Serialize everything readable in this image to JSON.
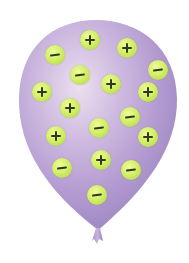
{
  "figure": {
    "balloon_color": "#b9a2d4",
    "balloon_highlight": "#e6d6ee",
    "balloon_shadow": "#9d86c2",
    "charge_color": "#cfe962",
    "sign_color": "#2f3a1c"
  },
  "charges": [
    {
      "type": "positive",
      "symbol": "+",
      "x": 90,
      "y": 40
    },
    {
      "type": "negative",
      "symbol": "−",
      "x": 55,
      "y": 55
    },
    {
      "type": "positive",
      "symbol": "+",
      "x": 127,
      "y": 48
    },
    {
      "type": "negative",
      "symbol": "−",
      "x": 158,
      "y": 70
    },
    {
      "type": "negative",
      "symbol": "−",
      "x": 80,
      "y": 75
    },
    {
      "type": "positive",
      "symbol": "+",
      "x": 111,
      "y": 84
    },
    {
      "type": "positive",
      "symbol": "+",
      "x": 42,
      "y": 92
    },
    {
      "type": "positive",
      "symbol": "+",
      "x": 148,
      "y": 92
    },
    {
      "type": "positive",
      "symbol": "+",
      "x": 70,
      "y": 108
    },
    {
      "type": "negative",
      "symbol": "−",
      "x": 130,
      "y": 117
    },
    {
      "type": "negative",
      "symbol": "−",
      "x": 99,
      "y": 128
    },
    {
      "type": "positive",
      "symbol": "+",
      "x": 56,
      "y": 136
    },
    {
      "type": "positive",
      "symbol": "+",
      "x": 148,
      "y": 137
    },
    {
      "type": "negative",
      "symbol": "−",
      "x": 62,
      "y": 168
    },
    {
      "type": "positive",
      "symbol": "+",
      "x": 101,
      "y": 160
    },
    {
      "type": "negative",
      "symbol": "−",
      "x": 131,
      "y": 170
    },
    {
      "type": "negative",
      "symbol": "−",
      "x": 97,
      "y": 195
    }
  ],
  "counts": {
    "positive": 9,
    "negative": 8
  }
}
